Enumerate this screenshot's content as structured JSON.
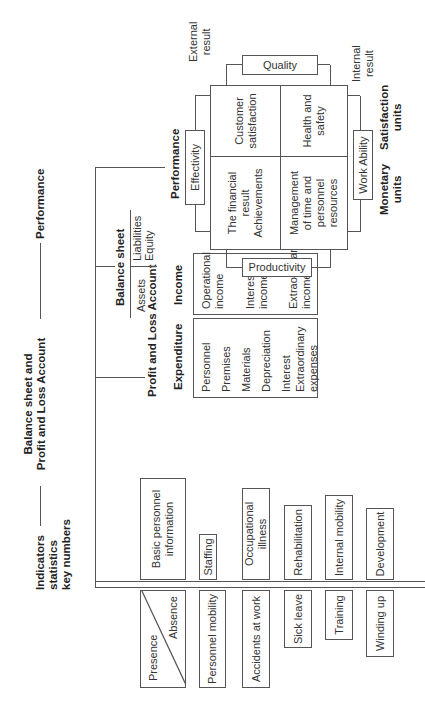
{
  "header": {
    "indicators": [
      "Indicators",
      "statistics",
      "key numbers"
    ],
    "balance_pl": [
      "Balance sheet and",
      "Profit and Loss Account"
    ],
    "performance": "Performance"
  },
  "indicators_column": {
    "presence_absence": {
      "presence": "Presence",
      "absence": "Absence"
    },
    "pairs": [
      {
        "upper": "Basic personnel information",
        "lower": "Presence / Absence"
      },
      {
        "upper": "Staffing",
        "lower": "Personnel mobility"
      },
      {
        "upper": "Occupational illness",
        "lower": "Accidents at work"
      },
      {
        "upper": "Rehabilitation",
        "lower": "Sick leave"
      },
      {
        "upper": "Internal mobility",
        "lower": "Training"
      },
      {
        "upper": "Development",
        "lower": "Winding up"
      }
    ],
    "basic_info_lines": [
      "Basic personnel",
      "information"
    ]
  },
  "profit_loss": {
    "title": "Profit and Loss Account",
    "expenditure": {
      "label": "Expenditure",
      "items": [
        "Personnel",
        "Premises",
        "Materials",
        "Depreciation",
        "Interest",
        "Extraordinary expenses"
      ]
    },
    "income": {
      "label": "Income",
      "items": [
        "Operational income",
        "Interest income",
        "Extraordinary income"
      ]
    }
  },
  "balance_sheet": {
    "title": "Balance sheet",
    "assets": "Assets",
    "liabilities": [
      "Liabilities",
      "Equity"
    ]
  },
  "performance_model": {
    "title": "Performance",
    "effectivity": "Effectivity",
    "productivity": "Productivity",
    "quality": "Quality",
    "work_ability": "Work Ability",
    "external_result": [
      "External",
      "result"
    ],
    "internal_result": [
      "Internal",
      "result"
    ],
    "monetary_units": [
      "Monetary",
      "units"
    ],
    "satisfaction_units": [
      "Satisfaction",
      "units"
    ],
    "quadrants": {
      "financial": [
        "The financial",
        "result",
        "Achievements"
      ],
      "customer": [
        "Customer",
        "satisfaction"
      ],
      "management": [
        "Management",
        "of time and",
        "personnel",
        "resources"
      ],
      "health": [
        "Health and",
        "safety"
      ]
    }
  }
}
